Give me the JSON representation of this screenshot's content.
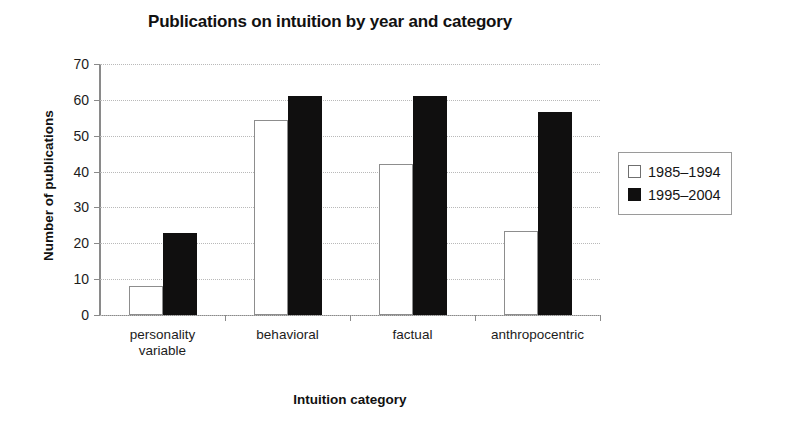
{
  "chart_data": {
    "type": "bar",
    "title": "Publications on intuition by year and category",
    "xlabel": "Intuition category",
    "ylabel": "Number of publications",
    "categories": [
      "personality\nvariable",
      "behavioral",
      "factual",
      "anthropocentric"
    ],
    "series": [
      {
        "name": "1985–1994",
        "color": "#ffffff",
        "values": [
          8,
          54.5,
          42,
          23.5
        ]
      },
      {
        "name": "1995–2004",
        "color": "#100f0f",
        "values": [
          23,
          61,
          61,
          56.5
        ]
      }
    ],
    "ylim": [
      0,
      70
    ],
    "yticks": [
      0,
      10,
      20,
      30,
      40,
      50,
      60,
      70
    ],
    "ytick_labels": [
      "0",
      "10",
      "20",
      "30",
      "40",
      "50",
      "60",
      "70"
    ],
    "grid": "horizontal-dotted",
    "legend_position": "right-outside"
  },
  "legend": {
    "entries": [
      {
        "label": "1985–1994",
        "swatch": "light"
      },
      {
        "label": "1995–2004",
        "swatch": "dark"
      }
    ]
  }
}
